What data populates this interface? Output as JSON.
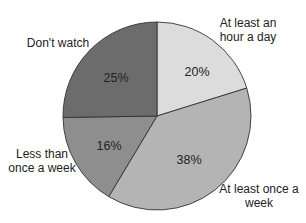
{
  "chart_data": {
    "type": "pie",
    "title": "",
    "start_angle_deg": 0,
    "direction": "clockwise",
    "categories": [
      "At least an hour a day",
      "At least once a week",
      "Less than once a week",
      "Don't watch"
    ],
    "values": [
      20,
      38,
      16,
      25
    ],
    "value_labels": [
      "20%",
      "38%",
      "16%",
      "25%"
    ],
    "colors": [
      "#dcdcdc",
      "#b4b4b4",
      "#8e8e8e",
      "#6c6c6c"
    ],
    "edge_color": "#333333",
    "legend": "none (direct labels outside slices)",
    "slices": [
      {
        "label_lines": [
          "At least an",
          "hour a day"
        ],
        "label_pos": [
          248,
          27
        ],
        "pct_label": "20%",
        "pct_pos": [
          197,
          76
        ]
      },
      {
        "label_lines": [
          "At least once a",
          "week"
        ],
        "label_pos": [
          259,
          193
        ],
        "pct_label": "38%",
        "pct_pos": [
          189,
          164
        ]
      },
      {
        "label_lines": [
          "Less than",
          "once a week"
        ],
        "label_pos": [
          42,
          158
        ],
        "pct_label": "16%",
        "pct_pos": [
          109,
          150
        ]
      },
      {
        "label_lines": [
          "Don't watch"
        ],
        "label_pos": [
          58,
          47
        ],
        "pct_label": "25%",
        "pct_pos": [
          116,
          82
        ]
      }
    ],
    "geometry": {
      "cx": 157,
      "cy": 116,
      "r": 94
    }
  }
}
